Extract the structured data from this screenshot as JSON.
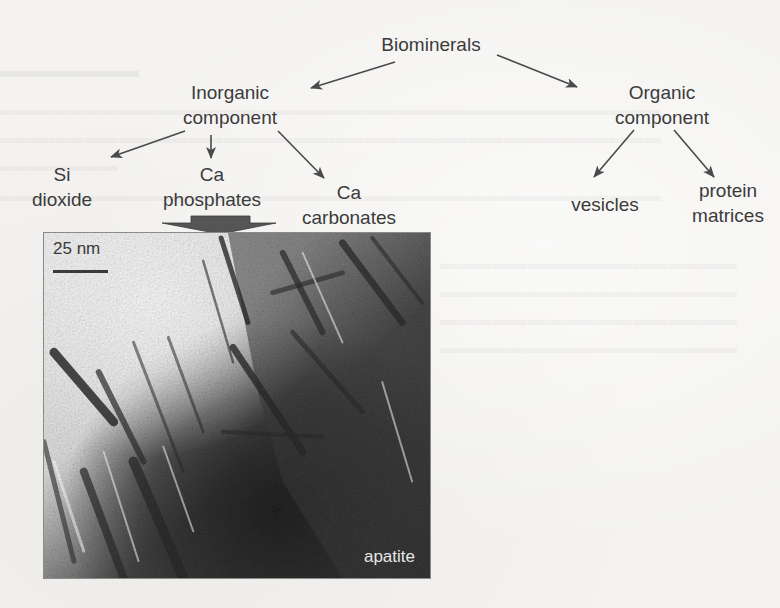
{
  "diagram": {
    "root": {
      "label": "Biominerals"
    },
    "branches": [
      {
        "id": "inorganic",
        "label_lines": [
          "Inorganic",
          "component"
        ],
        "children": [
          {
            "id": "si-dioxide",
            "label_lines": [
              "Si",
              "dioxide"
            ]
          },
          {
            "id": "ca-phosphates",
            "label_lines": [
              "Ca",
              "phosphates"
            ]
          },
          {
            "id": "ca-carbonates",
            "label_lines": [
              "Ca",
              "carbonates"
            ]
          }
        ]
      },
      {
        "id": "organic",
        "label_lines": [
          "Organic",
          "component"
        ],
        "children": [
          {
            "id": "vesicles",
            "label_lines": [
              "vesicles"
            ]
          },
          {
            "id": "protein-matrices",
            "label_lines": [
              "protein",
              "matrices"
            ]
          }
        ]
      }
    ],
    "highlight_arrow": {
      "from": "ca-phosphates",
      "to": "micrograph"
    }
  },
  "micrograph": {
    "scale_bar_label": "25 nm",
    "material_label": "apatite"
  },
  "colors": {
    "paper": "#f4f3f1",
    "text": "#3b3b3b",
    "arrow": "#4a4a4a",
    "block_arrow": "#555555",
    "micrograph_dark": "#2b2b2b",
    "micrograph_light": "#ededed",
    "label_on_dark": "#e6e6e6"
  }
}
